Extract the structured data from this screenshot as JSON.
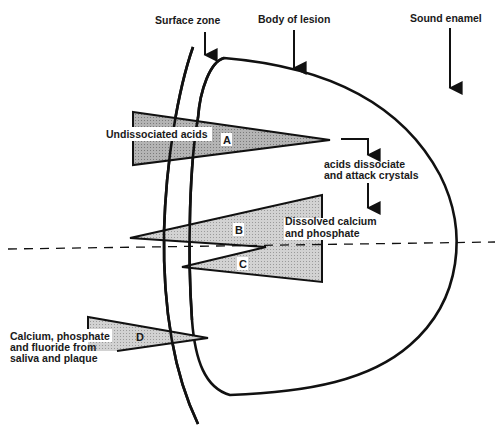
{
  "diagram": {
    "labels": {
      "surface_zone": "Surface zone",
      "body_of_lesion": "Body of lesion",
      "sound_enamel": "Sound enamel",
      "undissociated_acids": "Undissociated acids",
      "acids_dissociate_1": "acids dissociate",
      "acids_dissociate_2": "and attack crystals",
      "dissolved_1": "Dissolved calcium",
      "dissolved_2": "and phosphate",
      "source_1": "Calcium, phosphate",
      "source_2": "and fluoride from",
      "source_3": "saliva and plaque"
    },
    "wedges": {
      "a": "A",
      "b": "B",
      "c": "C",
      "d": "D"
    },
    "colors": {
      "line": "#111111",
      "wedge_a_fill": "#a9a9a9",
      "wedge_bc_fill": "#c8c8c8",
      "wedge_d_fill": "#d4d4d4"
    }
  }
}
